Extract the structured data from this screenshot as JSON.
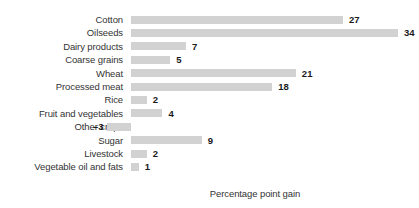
{
  "chart_data": {
    "type": "bar",
    "orientation": "horizontal",
    "title": "",
    "xlabel": "Percentage point gain",
    "ylabel": "",
    "grid": false,
    "legend": null,
    "xlim": [
      -3,
      34
    ],
    "baseline": 0,
    "categories": [
      "Cotton",
      "Oilseeds",
      "Dairy products",
      "Coarse grains",
      "Wheat",
      "Processed meat",
      "Rice",
      "Fruit and vegetables",
      "Other crops",
      "Sugar",
      "Livestock",
      "Vegetable oil and fats"
    ],
    "values": [
      27,
      34,
      7,
      5,
      21,
      18,
      2,
      4,
      -3,
      9,
      2,
      1
    ],
    "value_labels": [
      "27",
      "34",
      "7",
      "5",
      "21",
      "18",
      "2",
      "4",
      "–3",
      "9",
      "2",
      "1"
    ],
    "bar_color": "#d2d2d2",
    "label_color": "#333333",
    "value_color": "#1a1a1a",
    "background": "#ffffff"
  }
}
